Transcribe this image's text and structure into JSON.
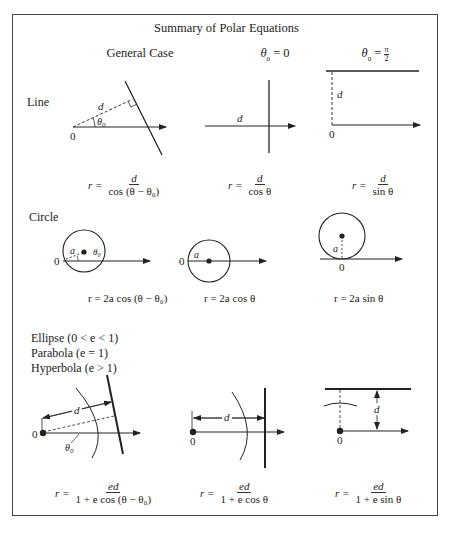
{
  "title": "Summary of Polar Equations",
  "columns": [
    {
      "label": "General Case"
    },
    {
      "label": "θ₀ = 0",
      "symbol": "θ",
      "sub": "0",
      "rhs": "0"
    },
    {
      "label": "θ₀ = π/2",
      "symbol": "θ",
      "sub": "0",
      "rhs_num": "π",
      "rhs_den": "2"
    }
  ],
  "rows": [
    {
      "label": "Line",
      "equations": [
        {
          "lhs": "r =",
          "num": "d",
          "den": "cos (θ − θ₀)"
        },
        {
          "lhs": "r =",
          "num": "d",
          "den": "cos θ"
        },
        {
          "lhs": "r =",
          "num": "d",
          "den": "sin  θ"
        }
      ]
    },
    {
      "label": "Circle",
      "equations": [
        {
          "text": "r = 2a cos (θ − θ₀)"
        },
        {
          "text": "r = 2a cos θ"
        },
        {
          "text": "r = 2a  sin θ"
        }
      ]
    },
    {
      "label_lines": [
        "Ellipse (0 < e < 1)",
        "Parabola (e = 1)",
        "Hyperbola (e > 1)"
      ],
      "equations": [
        {
          "lhs": "r =",
          "num": "ed",
          "den": "1 + e cos (θ − θ₀)"
        },
        {
          "lhs": "r =",
          "num": "ed",
          "den": "1 + e cos θ"
        },
        {
          "lhs": "r =",
          "num": "ed",
          "den": "1 + e sin θ"
        }
      ]
    }
  ],
  "diagram_labels": {
    "origin": "0",
    "distance": "d",
    "radius": "a",
    "angle": "θ₀"
  }
}
